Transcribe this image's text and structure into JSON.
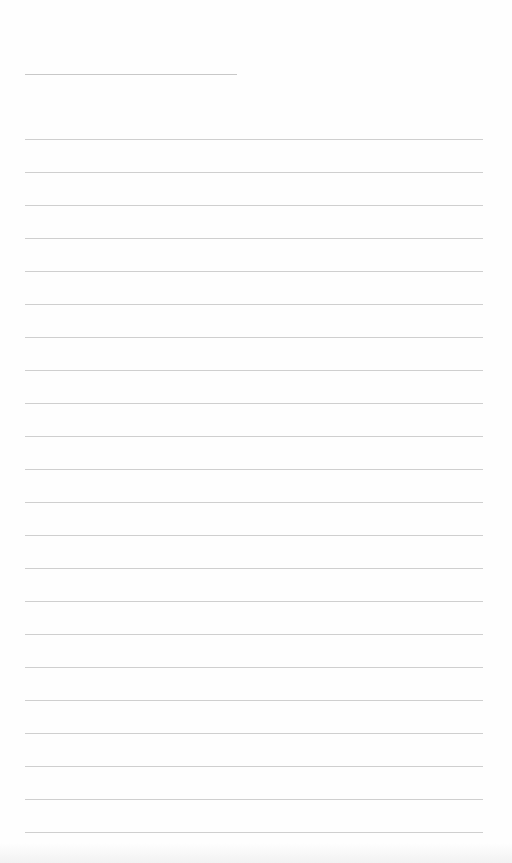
{
  "document": {
    "type": "lined-paper",
    "header_line": {
      "x": 25,
      "y": 74,
      "width": 212
    },
    "rules": {
      "count": 22,
      "first_y": 139,
      "spacing": 33,
      "x": 25,
      "width": 458
    },
    "colors": {
      "paper": "#fefefe",
      "rule": "#cfcfcf",
      "header_rule": "#c8c8c8"
    }
  }
}
